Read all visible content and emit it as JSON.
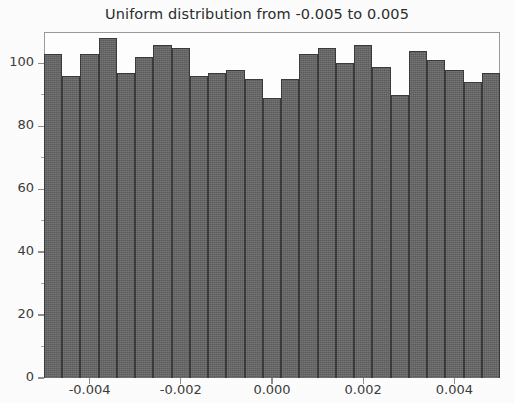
{
  "chart_data": {
    "type": "bar",
    "title": "Uniform distribution from -0.005 to 0.005",
    "xlabel": "",
    "ylabel": "",
    "grid": false,
    "legend": null,
    "xlim": [
      -0.005,
      0.005
    ],
    "ylim": [
      0,
      110
    ],
    "xticks": [
      -0.004,
      -0.002,
      0.0,
      0.002,
      0.004
    ],
    "xtick_labels": [
      "-0.004",
      "-0.002",
      "0.000",
      "0.002",
      "0.004"
    ],
    "yticks": [
      0,
      20,
      40,
      60,
      80,
      100
    ],
    "ytick_labels": [
      "0",
      "20",
      "40",
      "60",
      "80",
      "100"
    ],
    "bin_count": 25,
    "bin_edges": [
      -0.005,
      -0.0046,
      -0.0042,
      -0.0038,
      -0.0034,
      -0.003,
      -0.0026,
      -0.0022,
      -0.0018,
      -0.0014,
      -0.001,
      -0.0006,
      -0.0002,
      0.0002,
      0.0006,
      0.001,
      0.0014,
      0.0018,
      0.0022,
      0.0026,
      0.003,
      0.0034,
      0.0038,
      0.0042,
      0.0046,
      0.005
    ],
    "categories": [
      "-0.0048",
      "-0.0044",
      "-0.0040",
      "-0.0036",
      "-0.0032",
      "-0.0028",
      "-0.0024",
      "-0.0020",
      "-0.0016",
      "-0.0012",
      "-0.0008",
      "-0.0004",
      "0.0000",
      "0.0004",
      "0.0008",
      "0.0012",
      "0.0016",
      "0.0020",
      "0.0024",
      "0.0028",
      "0.0032",
      "0.0036",
      "0.0040",
      "0.0044",
      "0.0048"
    ],
    "values": [
      103,
      96,
      103,
      108,
      97,
      102,
      106,
      105,
      96,
      97,
      98,
      95,
      89,
      95,
      103,
      105,
      100,
      106,
      99,
      90,
      104,
      101,
      98,
      94,
      97
    ],
    "bar_color": "#656565",
    "bar_edge_color": "#3a3a3a"
  },
  "figure": {
    "background": "#fdfdfd",
    "axes_color": "#9a9a9a",
    "text_color": "#3a3a3a"
  }
}
